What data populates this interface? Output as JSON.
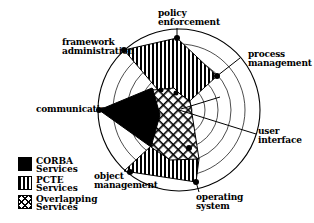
{
  "diagram": {
    "type": "radar",
    "center": [
      179,
      110
    ],
    "radius": 80,
    "rings": 6,
    "axes": [
      {
        "name": "policy enforcement",
        "line1": "policy",
        "line2": "enforcement"
      },
      {
        "name": "process management",
        "line1": "process",
        "line2": "management"
      },
      {
        "name": "user interface",
        "line1": "user",
        "line2": "interface"
      },
      {
        "name": "operating system",
        "line1": "operating",
        "line2": "system"
      },
      {
        "name": "object management",
        "line1": "object",
        "line2": "management"
      },
      {
        "name": "communication",
        "line1": "communication"
      },
      {
        "name": "framework administration",
        "line1": "framework",
        "line2": "administration"
      }
    ],
    "legend": [
      {
        "key": "corba",
        "line1": "CORBA",
        "line2": "Services",
        "fill": "solid-black"
      },
      {
        "key": "pcte",
        "line1": "PCTE",
        "line2": "Services",
        "fill": "vertical-stripes"
      },
      {
        "key": "overlap",
        "line1": "Overlapping",
        "line2": "Services",
        "fill": "crosshatch"
      }
    ]
  }
}
